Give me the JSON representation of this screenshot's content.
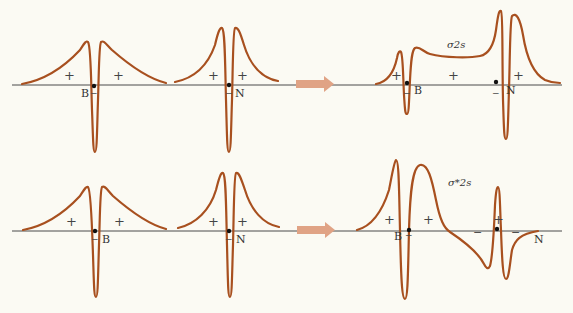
{
  "figure": {
    "rows": [
      {
        "name": "bonding",
        "atom_orbitals": [
          {
            "atom": "B",
            "signs": [
              "+",
              "+"
            ],
            "node_sign": "−"
          },
          {
            "atom": "N",
            "signs": [
              "+",
              "+"
            ],
            "node_sign": "−"
          }
        ],
        "molecular_orbital": {
          "label": "σ2s",
          "atoms": [
            "B",
            "N"
          ],
          "signs": [
            "+",
            "+",
            "+"
          ],
          "node_signs": [
            "−",
            "−"
          ]
        }
      },
      {
        "name": "antibonding",
        "atom_orbitals": [
          {
            "atom": "B",
            "signs": [
              "+",
              "+"
            ],
            "node_sign": "−"
          },
          {
            "atom": "N",
            "signs": [
              "+",
              "+"
            ],
            "node_sign": "−"
          }
        ],
        "molecular_orbital": {
          "label": "σ*2s",
          "atoms": [
            "B",
            "N"
          ],
          "signs": [
            "+",
            "+",
            "+"
          ],
          "node_signs": [
            "−",
            "−",
            "−"
          ]
        }
      }
    ],
    "colors": {
      "curve": "#a8501f",
      "arrow": "#e0a385",
      "axis": "#4a4a4a",
      "background": "#fbfaf3"
    }
  }
}
